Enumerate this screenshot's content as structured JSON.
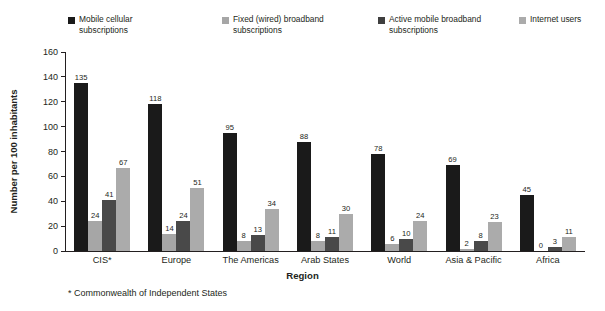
{
  "chart_data": {
    "type": "bar",
    "title": "",
    "xlabel": "Region",
    "ylabel": "Number per 100 inhabitants",
    "ylim": [
      0,
      160
    ],
    "yticks": [
      0,
      20,
      40,
      60,
      80,
      100,
      120,
      140,
      160
    ],
    "grid": false,
    "legend_position": "top",
    "categories": [
      "CIS*",
      "Europe",
      "The Americas",
      "Arab States",
      "World",
      "Asia & Pacific",
      "Africa"
    ],
    "series": [
      {
        "name": "Mobile cellular subscriptions",
        "color": "#1a1a1a",
        "values": [
          135,
          118,
          95,
          88,
          78,
          69,
          45
        ]
      },
      {
        "name": "Fixed (wired) broadband subscriptions",
        "color": "#a6a6a6",
        "values": [
          24,
          14,
          8,
          8,
          6,
          2,
          0
        ]
      },
      {
        "name": "Active mobile broadband subscriptions",
        "color": "#494949",
        "values": [
          41,
          24,
          13,
          11,
          10,
          8,
          3
        ]
      },
      {
        "name": "Internet users",
        "color": "#ababab",
        "values": [
          67,
          51,
          34,
          30,
          24,
          23,
          11
        ]
      }
    ],
    "annotations": [
      "* Commonwealth of Independent States"
    ]
  },
  "legend": {
    "items": [
      {
        "label": "Mobile cellular\nsubscriptions",
        "color": "#1a1a1a"
      },
      {
        "label": "Fixed (wired) broadband\nsubscriptions",
        "color": "#a6a6a6"
      },
      {
        "label": "Active mobile broadband\nsubscriptions",
        "color": "#3f3f3f"
      },
      {
        "label": "Internet users",
        "color": "#ababab"
      }
    ]
  },
  "axes": {
    "y_title": "Number per 100 inhabitants",
    "x_title": "Region",
    "y_ticks": [
      "160",
      "140",
      "120",
      "100",
      "80",
      "60",
      "40",
      "20",
      "0"
    ]
  },
  "footnote": "* Commonwealth of Independent States"
}
